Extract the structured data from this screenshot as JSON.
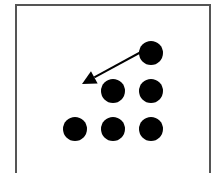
{
  "diagram": {
    "dot_color": "#000000",
    "arrow_color": "#000000",
    "frame_color": "#555555",
    "dots": [
      {
        "row": 1,
        "col": 3
      },
      {
        "row": 2,
        "col": 2
      },
      {
        "row": 2,
        "col": 3
      },
      {
        "row": 3,
        "col": 1
      },
      {
        "row": 3,
        "col": 2
      },
      {
        "row": 3,
        "col": 3
      }
    ],
    "arrow": {
      "from": {
        "row": 1,
        "col": 3
      },
      "to": {
        "row": 2,
        "col": 1
      }
    }
  }
}
